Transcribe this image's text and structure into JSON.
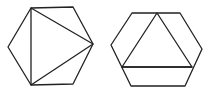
{
  "figure": {
    "stroke_color": "#222222",
    "background": "#ffffff",
    "shapes": [
      {
        "name": "left-hexagon",
        "hexagon_points": "31,8 73,7 93,44 73,84 31,85 8,47",
        "inscribed_triangle_points": "31,8 93,44 31,85"
      },
      {
        "name": "right-hexagon",
        "hexagon_points": "132,13 180,13 202,49 185,86 131,86 111,45",
        "inscribed_triangle_points": "157,13 122,67 192,67",
        "extra_line": {
          "x1": 122,
          "y1": 67,
          "x2": 192,
          "y2": 67
        }
      }
    ]
  }
}
